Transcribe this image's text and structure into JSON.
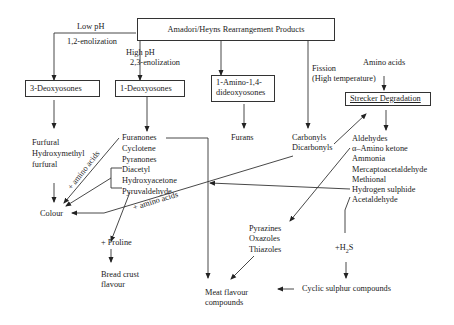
{
  "diagram": {
    "root": "Amadori/Heyns Rearrangement Products",
    "branches": {
      "low_ph": {
        "condition": "Low pH",
        "reaction": "1,2-enolization",
        "node": "3-Deoxyosones",
        "products": [
          "Furfural",
          "Hydroxymethyl",
          "furfural"
        ]
      },
      "high_ph": {
        "condition": "High pH",
        "reaction": "2,3-enolization",
        "node": "1-Deoxyosones",
        "products": [
          "Furanones",
          "Cyclotene",
          "Pyranones",
          "Diacetyl",
          "Hydroxyacetone",
          "Pyruvaldehyde"
        ]
      },
      "amino": {
        "node_line1": "1-Amino-1,4-",
        "node_line2": "dideoxyosones",
        "product": "Furans"
      },
      "fission": {
        "label_line1": "Fission",
        "label_line2": "(High temperature)",
        "products": [
          "Carbonyls",
          "Dicarbonyls"
        ]
      }
    },
    "strecker": {
      "input": "Amino acids",
      "node": "Strecker Degradation",
      "products": [
        "Aldehydes",
        "α–Amino ketone",
        "Ammonia",
        "Mercaptoacetaldehyde",
        "Methional",
        "Hydrogen sulphide",
        "Acetaldehyde"
      ]
    },
    "edge_labels": {
      "amino_acids_1": "+ amino acids",
      "amino_acids_2": "+ amino acids"
    },
    "outcomes": {
      "colour": "Colour",
      "proline": "+ Proline",
      "bread_line1": "Bread crust",
      "bread_line2": "flavour",
      "heterocycles": [
        "Pyrazines",
        "Oxazoles",
        "Thiazoles"
      ],
      "h2s_prefix": "+H",
      "h2s_sub": "2",
      "h2s_suffix": "S",
      "cyclic": "Cyclic sulphur compounds",
      "meat_line1": "Meat flavour",
      "meat_line2": "compounds"
    }
  }
}
